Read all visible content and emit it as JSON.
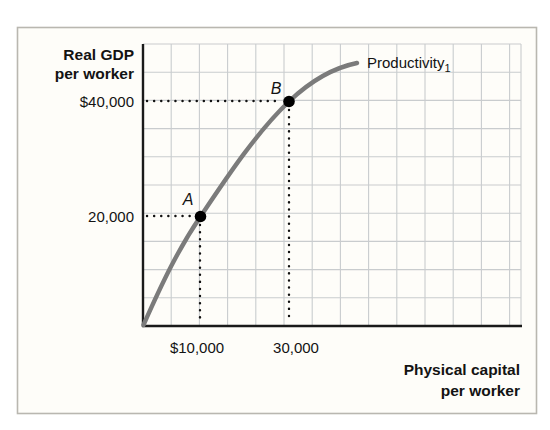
{
  "figure": {
    "y_axis_title_line1": "Real GDP",
    "y_axis_title_line2": "per worker",
    "x_axis_title_line1": "Physical capital",
    "x_axis_title_line2": "per worker",
    "y_tick_top": "$40,000",
    "y_tick_bottom": "20,000",
    "x_tick_left": "$10,000",
    "x_tick_right": "30,000",
    "curve_label": "Productivity",
    "curve_label_sub": "1",
    "point_a_label": "A",
    "point_b_label": "B"
  },
  "colors": {
    "curve": "#7b7b7b",
    "grid": "#c9ccce",
    "axis": "#1a1a1a",
    "text": "#131313",
    "frame_border": "#b9b7b0",
    "frame_fill": "#fefdf9",
    "point": "#000000",
    "guide": "#111111"
  },
  "chart_data": {
    "type": "line",
    "title": "",
    "xlabel": "Physical capital per worker",
    "ylabel": "Real GDP per worker",
    "series": [
      {
        "name": "Productivity1",
        "points": [
          {
            "x": 0,
            "y": 0
          },
          {
            "x": 10000,
            "y": 20000
          },
          {
            "x": 30000,
            "y": 40000
          },
          {
            "x": 44000,
            "y": 46000
          }
        ]
      }
    ],
    "marked_points": [
      {
        "label": "A",
        "x": 10000,
        "y": 20000
      },
      {
        "label": "B",
        "x": 30000,
        "y": 40000
      }
    ],
    "x_ticks": [
      {
        "value": 10000,
        "label": "$10,000"
      },
      {
        "value": 30000,
        "label": "30,000"
      }
    ],
    "y_ticks": [
      {
        "value": 40000,
        "label": "$40,000"
      },
      {
        "value": 20000,
        "label": "20,000"
      }
    ],
    "xlim": [
      0,
      40000
    ],
    "ylim": [
      0,
      50000
    ],
    "grid": true,
    "legend": "inline-curve-label",
    "guides": [
      {
        "point": "A",
        "h_line_y": 20000,
        "v_line_x": 10000,
        "style": "dotted"
      },
      {
        "point": "B",
        "h_line_y": 40000,
        "v_line_x": 30000,
        "style": "dotted"
      }
    ]
  }
}
